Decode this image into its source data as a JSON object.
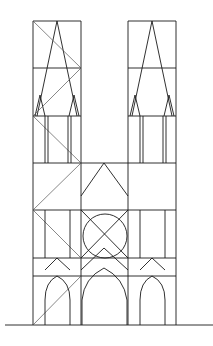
{
  "diagram": {
    "stroke_color": "#1a1a1a",
    "background": "#ffffff",
    "ground_line": {
      "x1": 5,
      "x2": 213,
      "y": 325
    },
    "towers": [
      {
        "name": "left",
        "x1": 33,
        "x2": 81,
        "top": 21,
        "apex_x": 57
      },
      {
        "name": "right",
        "x1": 128,
        "x2": 176,
        "top": 21,
        "apex_x": 152
      }
    ],
    "levels_y": [
      21,
      68,
      116,
      163,
      210,
      258,
      276,
      325
    ],
    "rose_window": {
      "cx": 105,
      "cy": 236,
      "r": 22
    }
  }
}
